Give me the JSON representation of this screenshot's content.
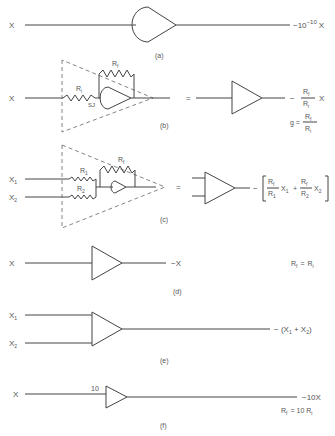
{
  "panels": {
    "a": {
      "caption": "(a)",
      "input": "X",
      "output_prefix": "−10",
      "output_exp": "−10",
      "output_suffix": "X"
    },
    "b": {
      "caption": "(b)",
      "input": "X",
      "ri_label": "R",
      "ri_sub": "i",
      "rf_label": "R",
      "rf_sub": "f",
      "sj_label": "SJ",
      "equals": "=",
      "output_minus": "−",
      "output_num": "R",
      "output_num_sub": "f",
      "output_den": "R",
      "output_den_sub": "i",
      "output_var": "X",
      "gain_label": "g =",
      "gain_num": "R",
      "gain_num_sub": "f",
      "gain_den": "R",
      "gain_den_sub": "i"
    },
    "c": {
      "caption": "(c)",
      "input1": "X",
      "input1_sub": "1",
      "input2": "X",
      "input2_sub": "2",
      "r1_label": "R",
      "r1_sub": "1",
      "r2_label": "R",
      "r2_sub": "2",
      "rf_label": "R",
      "rf_sub": "f",
      "equals": "=",
      "output_minus": "−",
      "term1_num": "R",
      "term1_num_sub": "f",
      "term1_den": "R",
      "term1_den_sub": "1",
      "term1_var": "X",
      "term1_var_sub": "1",
      "plus": "+",
      "term2_num": "R",
      "term2_num_sub": "f",
      "term2_den": "R",
      "term2_den_sub": "2",
      "term2_var": "X",
      "term2_var_sub": "2"
    },
    "d": {
      "caption": "(d)",
      "input": "X",
      "output": "−X",
      "condition_lhs": "R",
      "condition_lhs_sub": "f",
      "condition_eq": "=",
      "condition_rhs": "R",
      "condition_rhs_sub": "i"
    },
    "e": {
      "caption": "(e)",
      "input1": "X",
      "input1_sub": "1",
      "input2": "X",
      "input2_sub": "2",
      "output_prefix": "− (X",
      "output_sub1": "1",
      "output_mid": " + X",
      "output_sub2": "2",
      "output_suffix": ")"
    },
    "f": {
      "caption": "(f)",
      "input": "X",
      "gain_marker": "10",
      "output": "−10X",
      "condition_lhs": "R",
      "condition_lhs_sub": "f",
      "condition_eq": "= 10 R",
      "condition_rhs_sub": "i"
    }
  }
}
